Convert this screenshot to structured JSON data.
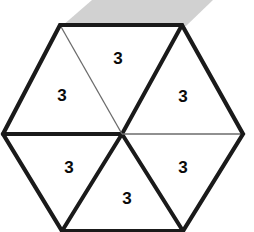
{
  "figure": {
    "name": "hexagon-six-triangles",
    "background_color": "#ffffff",
    "stroke_color": "#1a1a1a",
    "thin_stroke_color": "#6b6b6b",
    "label_color": "#0a0a0a",
    "smudge_color": "#c9c9c9",
    "vertices": {
      "top_left": [
        60,
        25
      ],
      "top_right": [
        182,
        25
      ],
      "right": [
        243,
        134
      ],
      "bottom_right": [
        183,
        231
      ],
      "bottom_left": [
        62,
        231
      ],
      "left": [
        3,
        134
      ],
      "center": [
        122,
        134
      ]
    },
    "outline_points": "60,25 182,25 243,134 183,231 62,231 3,134",
    "spokes": [
      {
        "name": "spoke-center-to-top-left",
        "from": [
          122,
          134
        ],
        "to": [
          60,
          25
        ],
        "weight": "thin"
      },
      {
        "name": "spoke-center-to-top-right",
        "from": [
          122,
          134
        ],
        "to": [
          182,
          25
        ],
        "weight": "thick"
      },
      {
        "name": "spoke-center-to-right",
        "from": [
          122,
          134
        ],
        "to": [
          243,
          134
        ],
        "weight": "thin"
      },
      {
        "name": "spoke-center-to-bottom-right",
        "from": [
          122,
          134
        ],
        "to": [
          183,
          231
        ],
        "weight": "thick"
      },
      {
        "name": "spoke-center-to-bottom-left",
        "from": [
          122,
          134
        ],
        "to": [
          62,
          231
        ],
        "weight": "thick"
      },
      {
        "name": "spoke-center-to-left",
        "from": [
          122,
          134
        ],
        "to": [
          3,
          134
        ],
        "weight": "thick"
      }
    ],
    "smudge": {
      "name": "gray-smudge",
      "points": "92,0 213,0 186,26 62,26"
    },
    "labels": [
      {
        "name": "label-triangle-top",
        "text": "3",
        "x": 118,
        "y": 58
      },
      {
        "name": "label-triangle-upper-left",
        "text": "3",
        "x": 62,
        "y": 95
      },
      {
        "name": "label-triangle-upper-right",
        "text": "3",
        "x": 183,
        "y": 96
      },
      {
        "name": "label-triangle-lower-left",
        "text": "3",
        "x": 69,
        "y": 167
      },
      {
        "name": "label-triangle-lower-right",
        "text": "3",
        "x": 183,
        "y": 167
      },
      {
        "name": "label-triangle-bottom",
        "text": "3",
        "x": 127,
        "y": 198
      }
    ]
  }
}
